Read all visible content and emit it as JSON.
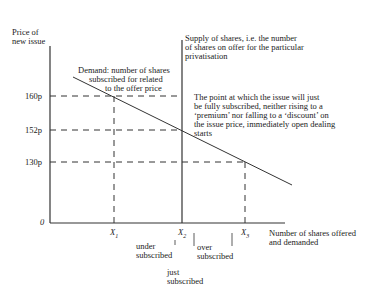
{
  "diagram": {
    "y_axis_label_line1": "Price of",
    "y_axis_label_line2": "new issue",
    "x_axis_label_line1": "Number of shares offered",
    "x_axis_label_line2": "and demanded",
    "origin_label": "0",
    "price_ticks": [
      "160p",
      "152p",
      "130p"
    ],
    "quantity_ticks": [
      "X",
      "X",
      "X"
    ],
    "quantity_subscripts": [
      "1",
      "2",
      "3"
    ],
    "demand_label": [
      "Demand: number of shares",
      "subscribed for related",
      "to the offer price"
    ],
    "supply_label": [
      "Supply of shares, i.e. the number",
      "of shares on offer for the particular",
      "privatisation"
    ],
    "equilibrium_note": [
      "The point at which the issue will just",
      "be fully subscribed, neither rising to a",
      "‘premium’ nor falling to a ‘discount’ on",
      "the issue price, immediately open dealing",
      "starts"
    ],
    "region_under": [
      "under",
      "subscribed"
    ],
    "region_over": [
      "over",
      "subscribed"
    ],
    "region_just": [
      "just",
      "subscribed"
    ]
  }
}
